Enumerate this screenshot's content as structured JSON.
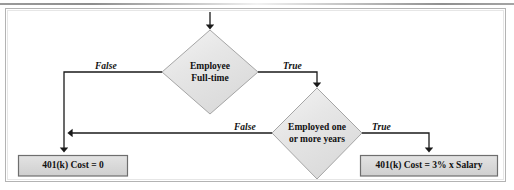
{
  "diagram": {
    "type": "flowchart",
    "colors": {
      "node_fill": "#e4e4e4",
      "node_fill_light": "#f2f2f2",
      "node_stroke": "#9a9a9a",
      "box_fill": "#d9d9d9",
      "box_stroke": "#6e6e6e",
      "connector": "#1a1a1a",
      "frame_stroke": "#b3b3b3",
      "text": "#111111"
    },
    "decisions": [
      {
        "id": "decision-employee-fulltime",
        "line1": "Employee",
        "line2": "Full-time",
        "true_label": "True",
        "false_label": "False"
      },
      {
        "id": "decision-employed-one-or-more-years",
        "line1": "Employed one",
        "line2": "or more years",
        "true_label": "True",
        "false_label": "False"
      }
    ],
    "terminals": [
      {
        "id": "result-zero-cost",
        "label": "401(k) Cost = 0"
      },
      {
        "id": "result-three-percent-salary",
        "label": "401(k) Cost = 3% x Salary"
      }
    ],
    "edges": [
      {
        "id": "entry",
        "label": ""
      },
      {
        "id": "fulltime-false",
        "label": "False"
      },
      {
        "id": "fulltime-true",
        "label": "True"
      },
      {
        "id": "years-false",
        "label": "False"
      },
      {
        "id": "years-true",
        "label": "True"
      }
    ]
  }
}
